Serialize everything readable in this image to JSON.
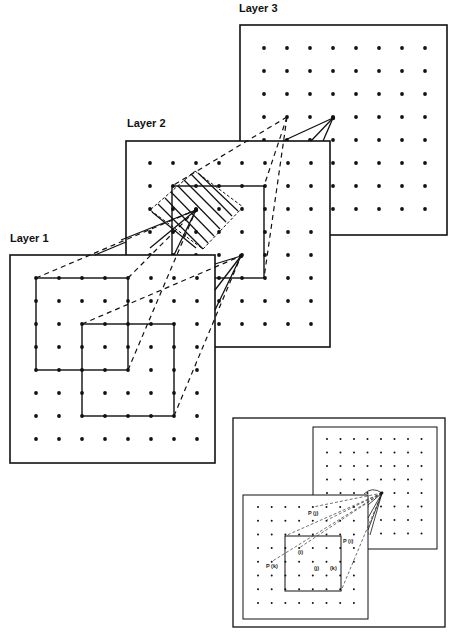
{
  "layers": [
    {
      "id": "layer3",
      "label": "Layer 3",
      "label_pos": [
        239,
        10
      ],
      "box": [
        240,
        25,
        207,
        210
      ],
      "grid": {
        "x0": 264,
        "y0": 48,
        "step": 23,
        "cols": 8,
        "rows": 8
      }
    },
    {
      "id": "layer2",
      "label": "Layer 2",
      "label_pos": [
        127,
        126
      ],
      "box": [
        126,
        141,
        204,
        206
      ],
      "grid": {
        "x0": 150,
        "y0": 163,
        "step": 23,
        "cols": 8,
        "rows": 8
      }
    },
    {
      "id": "layer1",
      "label": "Layer 1",
      "label_pos": [
        10,
        236
      ],
      "box": [
        10,
        255,
        205,
        208
      ],
      "grid": {
        "x0": 36,
        "y0": 278,
        "step": 23,
        "cols": 8,
        "rows": 8
      }
    }
  ],
  "inset": {
    "outer_box": [
      233,
      418,
      212,
      209
    ],
    "upper_layer": {
      "box": [
        313,
        427,
        124,
        122
      ],
      "grid": {
        "x0": 327,
        "y0": 439,
        "step": 13.5,
        "cols": 8,
        "rows": 8
      }
    },
    "lower_layer": {
      "box": [
        243,
        495,
        125,
        124
      ],
      "grid": {
        "x0": 258,
        "y0": 507,
        "step": 13.7,
        "cols": 8,
        "rows": 8
      }
    },
    "labels": {
      "pj": "P (j)",
      "pi": "P (i)",
      "pk": "P (k)",
      "i": "(i)",
      "j": "(j)",
      "k": "(k)"
    }
  },
  "colors": {
    "ink": "#111111",
    "background": "#ffffff"
  }
}
